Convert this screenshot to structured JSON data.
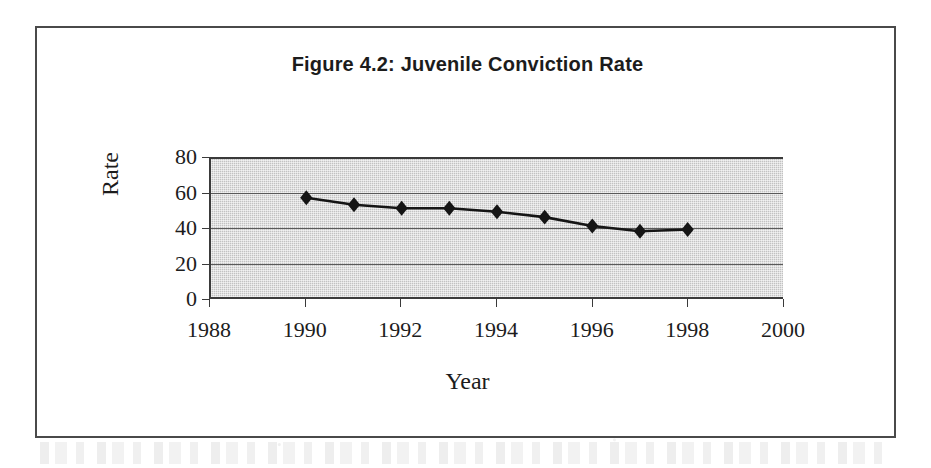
{
  "figure": {
    "title": "Figure 4.2: Juvenile Conviction Rate",
    "border_color": "#4a4a4a"
  },
  "chart_data": {
    "type": "line",
    "title": "Figure 4.2: Juvenile Conviction Rate",
    "xlabel": "Year",
    "ylabel": "Rate",
    "x": [
      1990,
      1991,
      1992,
      1993,
      1994,
      1995,
      1996,
      1997,
      1998
    ],
    "values": [
      57,
      53,
      51,
      51,
      49,
      46,
      41,
      38,
      39
    ],
    "series": [
      {
        "name": "Juvenile Conviction Rate",
        "values": [
          57,
          53,
          51,
          51,
          49,
          46,
          41,
          38,
          39
        ]
      }
    ],
    "xlim": [
      1988,
      2000
    ],
    "ylim": [
      0,
      80
    ],
    "xticks": [
      1988,
      1990,
      1992,
      1994,
      1996,
      1998,
      2000
    ],
    "xtick_labels": [
      "1988",
      "1990",
      "1992",
      "1994",
      "1996",
      "1998",
      "2000"
    ],
    "yticks": [
      0,
      20,
      40,
      60,
      80
    ],
    "ytick_labels": [
      "0",
      "20",
      "40",
      "60",
      "80"
    ],
    "grid": "horizontal",
    "legend": "none",
    "marker": "diamond",
    "marker_color": "#151515",
    "line_color": "#151515",
    "plot_background": "#c2c2c2",
    "gridline_color": "#5a5a5a"
  }
}
